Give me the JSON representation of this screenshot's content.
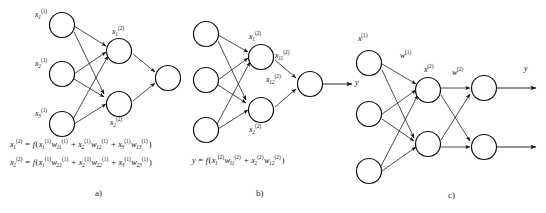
{
  "figure": {
    "kind": "neural-network-diagram",
    "background_color": "#ffffff",
    "stroke_color": "#1a1a1a",
    "node_fill": "#ffffff",
    "panels": [
      {
        "id": "a",
        "label": "a)",
        "node_labels": [
          {
            "name": "input-1",
            "base": "x",
            "sub": "1",
            "sup": "(1)"
          },
          {
            "name": "input-2",
            "base": "x",
            "sub": "2",
            "sup": "(1)"
          },
          {
            "name": "input-3",
            "base": "x",
            "sub": "3",
            "sup": "(1)"
          },
          {
            "name": "hidden-1",
            "base": "x",
            "sub": "1",
            "sup": "(2)"
          },
          {
            "name": "hidden-2",
            "base": "x",
            "sub": "2",
            "sup": "(2)"
          }
        ],
        "formulas": [
          {
            "name": "hidden-1-activation",
            "parts": [
              {
                "base": "x",
                "sub": "1",
                "sup": "(2)"
              },
              {
                "op": " = "
              },
              {
                "base": "f",
                "plain": true
              },
              {
                "op": "("
              },
              {
                "base": "x",
                "sub": "1",
                "sup": "(1)"
              },
              {
                "base": "w",
                "sub": "11",
                "sup": "(1)"
              },
              {
                "op": " + "
              },
              {
                "base": "x",
                "sub": "2",
                "sup": "(1)"
              },
              {
                "base": "w",
                "sub": "12",
                "sup": "(1)"
              },
              {
                "op": " + "
              },
              {
                "base": "x",
                "sub": "3",
                "sup": "(1)"
              },
              {
                "base": "w",
                "sub": "13",
                "sup": "(1)"
              },
              {
                "op": ")"
              }
            ]
          },
          {
            "name": "hidden-2-activation",
            "parts": [
              {
                "base": "x",
                "sub": "2",
                "sup": "(2)"
              },
              {
                "op": " = "
              },
              {
                "base": "f",
                "plain": true
              },
              {
                "op": "("
              },
              {
                "base": "x",
                "sub": "1",
                "sup": "(1)"
              },
              {
                "base": "w",
                "sub": "21",
                "sup": "(1)"
              },
              {
                "op": " + "
              },
              {
                "base": "x",
                "sub": "2",
                "sup": "(1)"
              },
              {
                "base": "w",
                "sub": "22",
                "sup": "(1)"
              },
              {
                "op": " + "
              },
              {
                "base": "x",
                "sub": "3",
                "sup": "(1)"
              },
              {
                "base": "w",
                "sub": "23",
                "sup": "(1)"
              },
              {
                "op": ")"
              }
            ]
          }
        ]
      },
      {
        "id": "b",
        "label": "b)",
        "node_labels": [
          {
            "name": "hidden-1",
            "base": "x",
            "sub": "1",
            "sup": "(2)"
          },
          {
            "name": "hidden-2",
            "base": "x",
            "sub": "2",
            "sup": "(2)"
          },
          {
            "name": "weight-11",
            "base": "x",
            "sub": "11",
            "sup": "(2)"
          },
          {
            "name": "weight-12",
            "base": "x",
            "sub": "12",
            "sup": "(2)"
          },
          {
            "name": "output",
            "base": "y",
            "sub": "",
            "sup": ""
          }
        ],
        "formulas": [
          {
            "name": "output-activation",
            "parts": [
              {
                "base": "y",
                "sub": "",
                "sup": ""
              },
              {
                "op": " = "
              },
              {
                "base": "f",
                "plain": true
              },
              {
                "op": "("
              },
              {
                "base": "x",
                "sub": "1",
                "sup": "(2)"
              },
              {
                "base": "w",
                "sub": "11",
                "sup": "(2)"
              },
              {
                "op": " + "
              },
              {
                "base": "x",
                "sub": "2",
                "sup": "(2)"
              },
              {
                "base": "w",
                "sub": "12",
                "sup": "(2)"
              },
              {
                "op": ")"
              }
            ]
          }
        ]
      },
      {
        "id": "c",
        "label": "c)",
        "node_labels": [
          {
            "name": "input-vector",
            "base": "x",
            "sub": "",
            "sup": "(1)"
          },
          {
            "name": "weight-1",
            "base": "w",
            "sub": "",
            "sup": "(1)"
          },
          {
            "name": "hidden-vector",
            "base": "x",
            "sub": "",
            "sup": "(2)"
          },
          {
            "name": "weight-2",
            "base": "w",
            "sub": "",
            "sup": "(2)"
          },
          {
            "name": "output-vector",
            "base": "y",
            "sub": "",
            "sup": ""
          }
        ],
        "formulas": []
      }
    ]
  },
  "labels": {
    "a": {
      "in1": "x",
      "in1_sub": "1",
      "in1_sup": "(1)",
      "in2": "x",
      "in2_sub": "2",
      "in2_sup": "(1)",
      "in3": "x",
      "in3_sub": "3",
      "in3_sup": "(1)",
      "h1": "x",
      "h1_sub": "1",
      "h1_sup": "(2)",
      "h2": "x",
      "h2_sub": "2",
      "h2_sup": "(2)",
      "panel": "a)"
    },
    "b": {
      "h1": "x",
      "h1_sub": "1",
      "h1_sup": "(2)",
      "h2": "x",
      "h2_sub": "2",
      "h2_sup": "(2)",
      "w11": "x",
      "w11_sub": "11",
      "w11_sup": "(2)",
      "w12": "x",
      "w12_sub": "12",
      "w12_sup": "(2)",
      "y": "y",
      "panel": "b)"
    },
    "c": {
      "x1": "x",
      "x1_sup": "(1)",
      "w1": "w",
      "w1_sup": "(1)",
      "x2": "x",
      "x2_sup": "(2)",
      "w2": "w",
      "w2_sup": "(2)",
      "y": "y",
      "panel": "c)"
    }
  }
}
